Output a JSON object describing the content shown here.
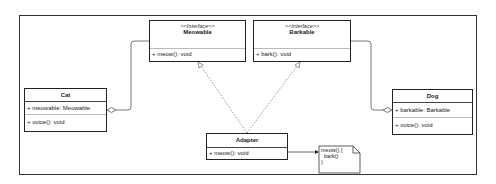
{
  "diagram": {
    "type": "UML class diagram (Adapter pattern)",
    "classes": [
      {
        "id": "meowable",
        "stereotype": "<<Interface>>",
        "name": "Meowable",
        "attributes": [],
        "methods": [
          "+ meow(): void"
        ]
      },
      {
        "id": "barkable",
        "stereotype": "<<Interface>>",
        "name": "Barkable",
        "attributes": [],
        "methods": [
          "+ bark(): void"
        ]
      },
      {
        "id": "cat",
        "name": "Cat",
        "attributes": [
          "+ meowable: Meowable"
        ],
        "methods": [
          "+ voice(): void"
        ]
      },
      {
        "id": "dog",
        "name": "Dog",
        "attributes": [
          "+ barkable: Barkable"
        ],
        "methods": [
          "+ voice(): void"
        ]
      },
      {
        "id": "adapter",
        "name": "Adapter",
        "attributes": [],
        "methods": [
          "+ meow(): void"
        ]
      }
    ],
    "note": {
      "text": "meow() {\n  bark()\n}"
    },
    "relations": [
      {
        "from": "cat",
        "to": "meowable",
        "kind": "aggregation"
      },
      {
        "from": "dog",
        "to": "barkable",
        "kind": "aggregation"
      },
      {
        "from": "adapter",
        "to": "meowable",
        "kind": "realization"
      },
      {
        "from": "adapter",
        "to": "barkable",
        "kind": "realization"
      },
      {
        "from": "adapter",
        "to": "note",
        "kind": "note-link"
      }
    ],
    "colors": {
      "line": "#333333",
      "background": "#ffffff"
    }
  }
}
